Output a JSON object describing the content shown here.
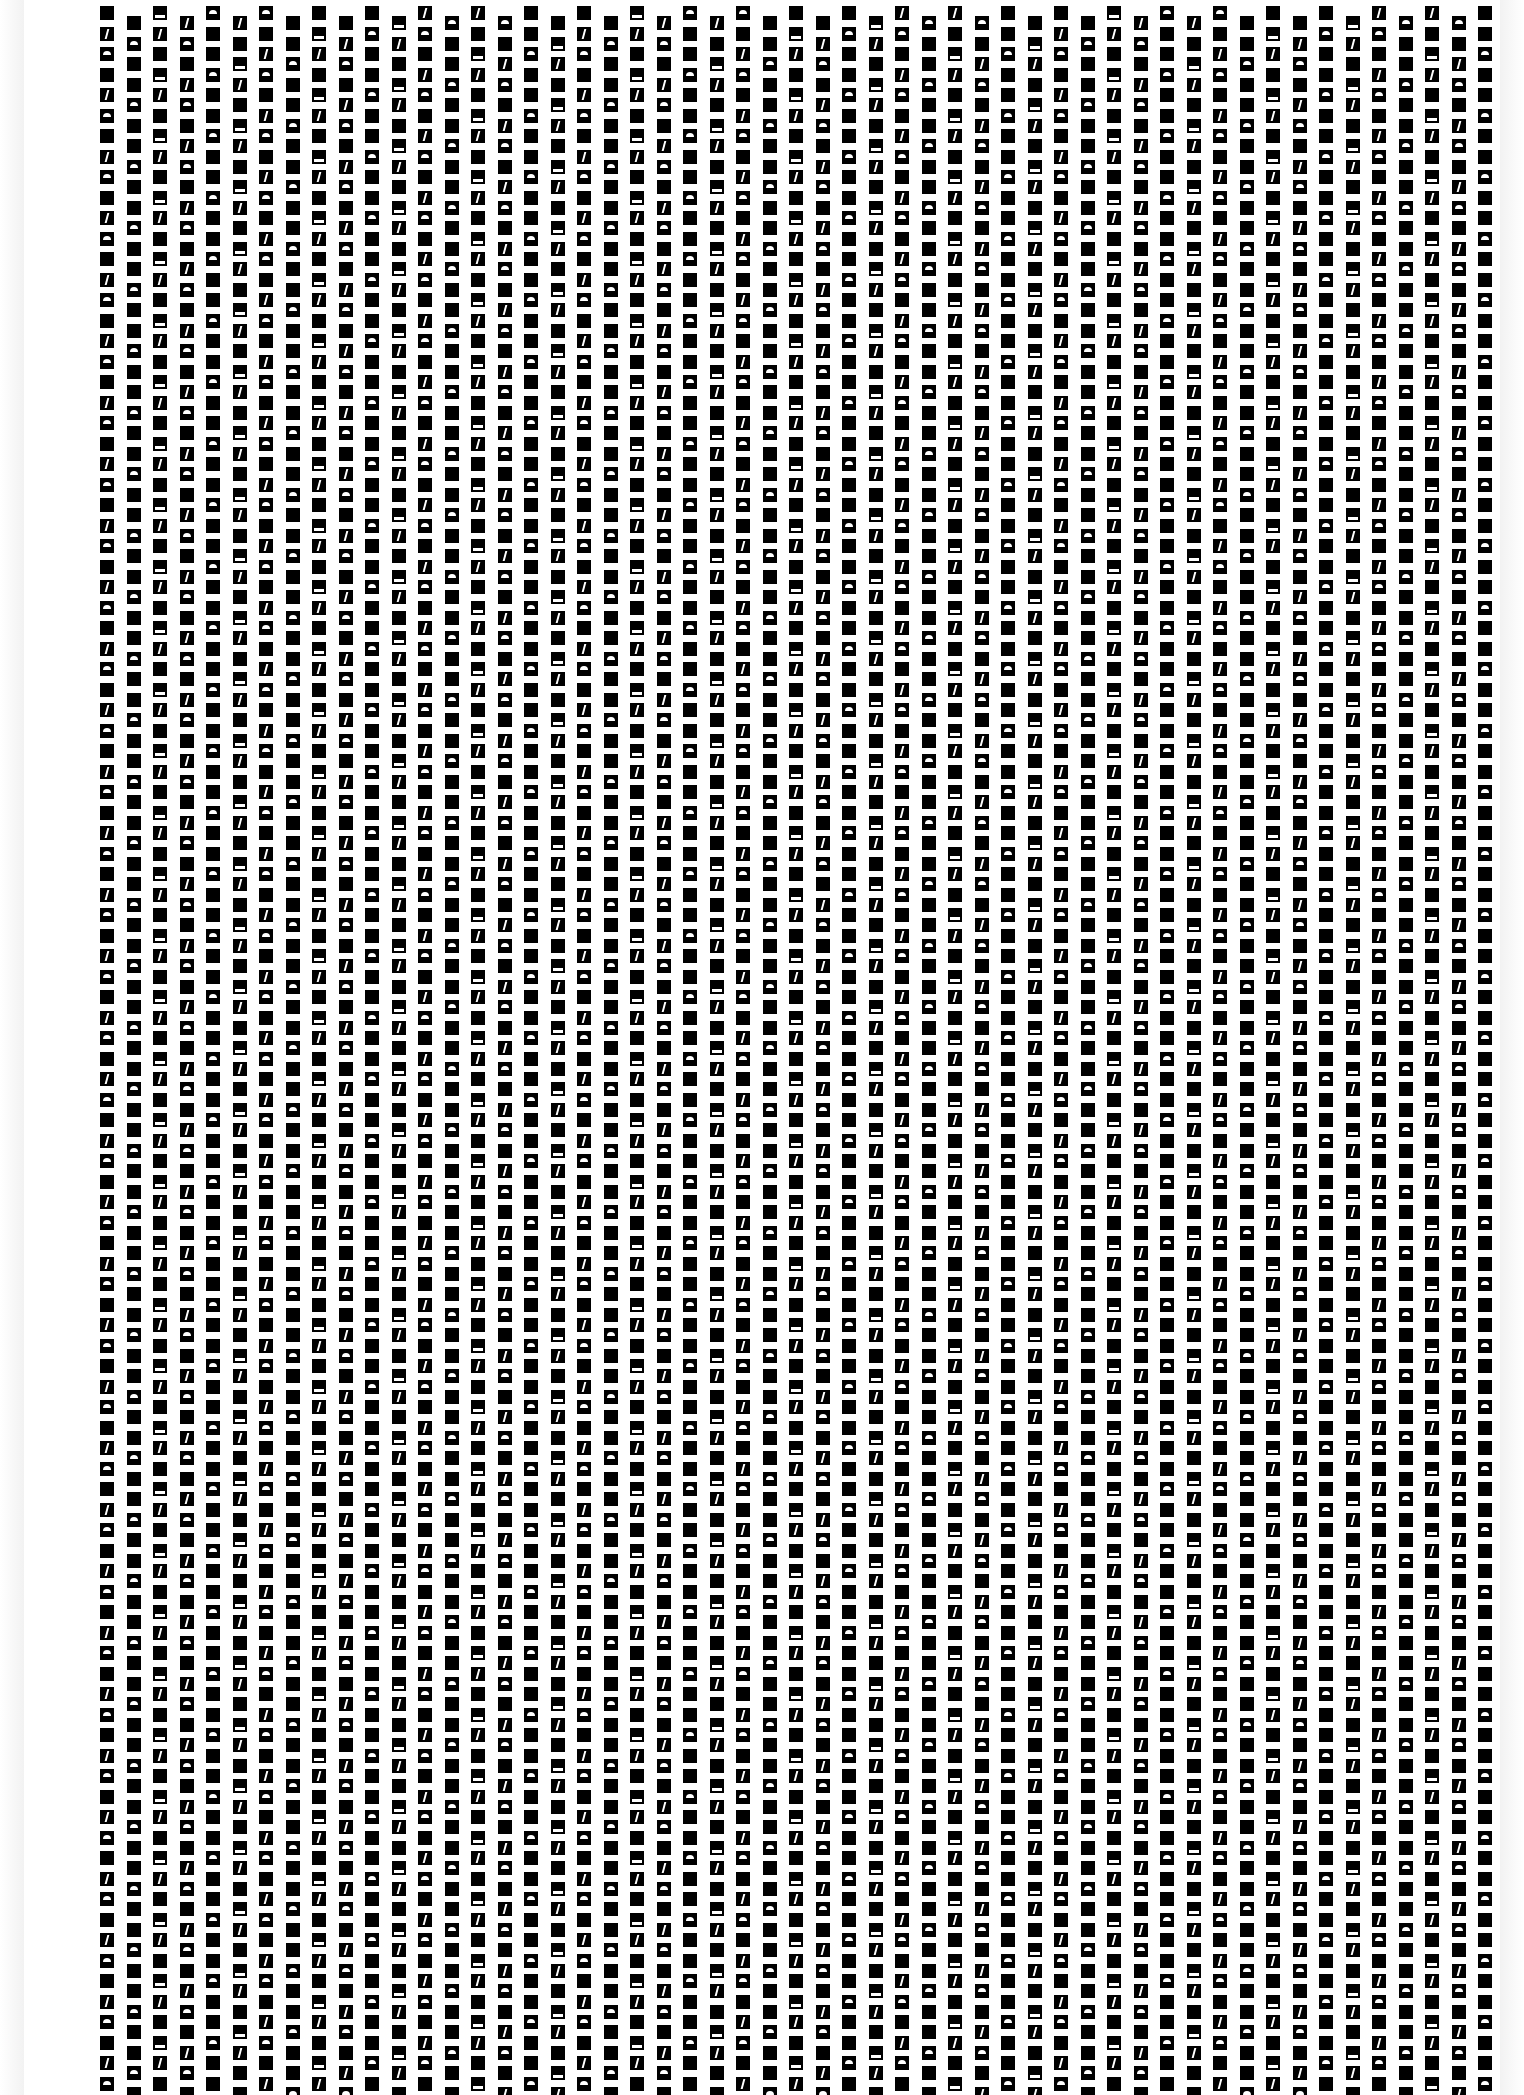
{
  "image": {
    "description": "Scanned page of a dense staggered grid of black squares with reversed-out glyph fragments",
    "background": "#ffffff",
    "ink": "#000000"
  },
  "grid": {
    "left": 100,
    "top": 6,
    "width": 1415,
    "col_pitch": 26.5,
    "row_pitch": 20.5,
    "cell_size": 14,
    "stagger": 10.25,
    "columns": 54,
    "rows": 102
  }
}
